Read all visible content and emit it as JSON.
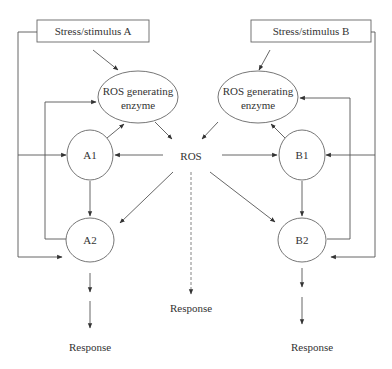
{
  "diagram": {
    "stimuli": {
      "a": "Stress/stimulus A",
      "b": "Stress/stimulus B"
    },
    "enzymes": {
      "a": {
        "line1": "ROS generating",
        "line2": "enzyme"
      },
      "b": {
        "line1": "ROS generating",
        "line2": "enzyme"
      }
    },
    "center_node": "ROS",
    "nodes": {
      "a1": "A1",
      "a2": "A2",
      "b1": "B1",
      "b2": "B2"
    },
    "responses": {
      "left": "Response",
      "center": "Response",
      "right": "Response"
    },
    "edges": [
      {
        "from": "Stress/stimulus A",
        "to": "ROS generating enzyme (A)",
        "style": "solid"
      },
      {
        "from": "Stress/stimulus B",
        "to": "ROS generating enzyme (B)",
        "style": "solid"
      },
      {
        "from": "ROS generating enzyme (A)",
        "to": "ROS",
        "style": "solid"
      },
      {
        "from": "ROS generating enzyme (B)",
        "to": "ROS",
        "style": "solid"
      },
      {
        "from": "ROS",
        "to": "A1",
        "style": "solid"
      },
      {
        "from": "ROS",
        "to": "B1",
        "style": "solid"
      },
      {
        "from": "ROS",
        "to": "A2",
        "style": "solid"
      },
      {
        "from": "ROS",
        "to": "B2",
        "style": "solid"
      },
      {
        "from": "ROS",
        "to": "Response (center)",
        "style": "dashed"
      },
      {
        "from": "A1",
        "to": "ROS generating enzyme (A)",
        "style": "solid"
      },
      {
        "from": "B1",
        "to": "ROS generating enzyme (B)",
        "style": "solid"
      },
      {
        "from": "A1",
        "to": "A2",
        "style": "solid"
      },
      {
        "from": "B1",
        "to": "B2",
        "style": "solid"
      },
      {
        "from": "A2",
        "to": "ROS generating enzyme (A)",
        "style": "solid feedback"
      },
      {
        "from": "B2",
        "to": "ROS generating enzyme (B)",
        "style": "solid feedback"
      },
      {
        "from": "Stress/stimulus A",
        "to": "A1",
        "style": "solid"
      },
      {
        "from": "Stress/stimulus A",
        "to": "A2",
        "style": "solid"
      },
      {
        "from": "Stress/stimulus B",
        "to": "B1",
        "style": "solid"
      },
      {
        "from": "Stress/stimulus B",
        "to": "B2",
        "style": "solid"
      },
      {
        "from": "A2",
        "to": "Response (left)",
        "style": "solid"
      },
      {
        "from": "B2",
        "to": "Response (right)",
        "style": "solid"
      }
    ]
  },
  "colors": {
    "line": "#555555",
    "node_stroke": "#666666",
    "text": "#333333",
    "background": "#ffffff"
  }
}
